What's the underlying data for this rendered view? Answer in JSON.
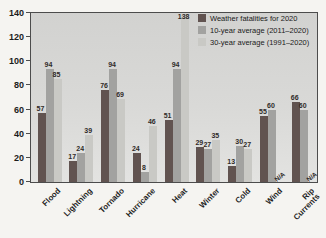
{
  "chart_data": {
    "type": "bar",
    "title": "",
    "xlabel": "",
    "ylabel": "",
    "categories": [
      "Flood",
      "Lightning",
      "Tornado",
      "Hurricane",
      "Heat",
      "Winter",
      "Cold",
      "Wind",
      "Rip\nCurrents"
    ],
    "series": [
      {
        "name": "Weather fatalities for 2020",
        "color": "#615350",
        "values": [
          57,
          17,
          76,
          24,
          51,
          29,
          13,
          55,
          66
        ]
      },
      {
        "name": "10-year average (2011–2020)",
        "color": "#a2a2a0",
        "values": [
          94,
          24,
          94,
          8,
          94,
          27,
          30,
          60,
          60
        ]
      },
      {
        "name": "30-year average (1991–2020)",
        "color": "#c9c9c5",
        "values": [
          85,
          39,
          69,
          46,
          138,
          35,
          27,
          null,
          null
        ]
      }
    ],
    "na_label": "N/A",
    "ylim": [
      0,
      140
    ],
    "ytick_step": 20,
    "yticks": [
      0,
      20,
      40,
      60,
      80,
      100,
      120,
      140
    ],
    "grid": false,
    "legend_position": "top-right-inside"
  }
}
